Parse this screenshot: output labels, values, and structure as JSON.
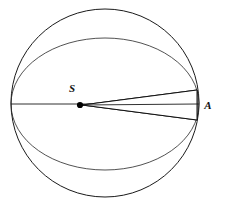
{
  "figure": {
    "kind": "geometry-diagram",
    "background_color": "#ffffff",
    "line_color": "#1a1a1a",
    "hatch_color": "#161616",
    "width": 226,
    "height": 206
  },
  "labels": {
    "source_point": "S",
    "target_point": "A"
  },
  "geometry": {
    "sphere_outline": {
      "name": "outer-circle",
      "cx": 105,
      "cy": 103,
      "r": 94
    },
    "equator_ellipse": {
      "name": "equator-ellipse",
      "cx": 105,
      "cy": 104,
      "rx": 94,
      "ry": 66
    },
    "axis": {
      "name": "horizontal-diameter",
      "x1": 11,
      "y1": 104,
      "x2": 199,
      "y2": 104
    },
    "source_dot": {
      "cx": 80,
      "cy": 105,
      "r": 3.1
    },
    "cone": {
      "apex_x": 82,
      "apex_y": 105,
      "base_x": 197,
      "half_width_top": 15,
      "half_width_bottom": 15,
      "hatch_spacing": 7,
      "hatch_angle_deg": 38
    },
    "label_positions": {
      "S": {
        "x": 72,
        "y": 92
      },
      "A": {
        "x": 208,
        "y": 109
      }
    }
  }
}
